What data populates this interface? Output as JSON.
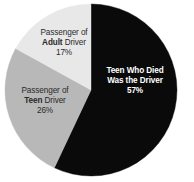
{
  "chart_data": {
    "type": "pie",
    "title": "",
    "subtitle": "",
    "xlabel": "",
    "ylabel": "",
    "legend_position": "none",
    "grid": false,
    "start_angle_deg": 0,
    "direction": "clockwise",
    "categories": [
      "Teen Who Died Was the Driver",
      "Passenger of Teen Driver",
      "Passenger of Adult Driver"
    ],
    "values": [
      57,
      26,
      17
    ],
    "value_unit": "%",
    "colors": [
      "#0a0a0a",
      "#b8b8b8",
      "#e8e8e8"
    ],
    "slices": [
      {
        "id": "teen-driver-death",
        "label_line1": "Teen Who Died",
        "label_line2": "Was the Driver",
        "label_strong": "",
        "percent_text": "57%",
        "value": 57,
        "color": "#0a0a0a",
        "text_color": "#ffffff"
      },
      {
        "id": "passenger-teen",
        "label_line1": "Passenger of",
        "label_line2_pre": "",
        "label_strong": "Teen",
        "label_line2_post": " Driver",
        "percent_text": "26%",
        "value": 26,
        "color": "#b8b8b8",
        "text_color": "#2a2a2a"
      },
      {
        "id": "passenger-adult",
        "label_line1": "Passenger of",
        "label_line2_pre": "",
        "label_strong": "Adult",
        "label_line2_post": " Driver",
        "percent_text": "17%",
        "value": 17,
        "color": "#e8e8e8",
        "text_color": "#2a2a2a"
      }
    ]
  },
  "figure": {
    "background": "#ffffff",
    "center_x": 91,
    "center_y": 90,
    "radius": 86
  }
}
